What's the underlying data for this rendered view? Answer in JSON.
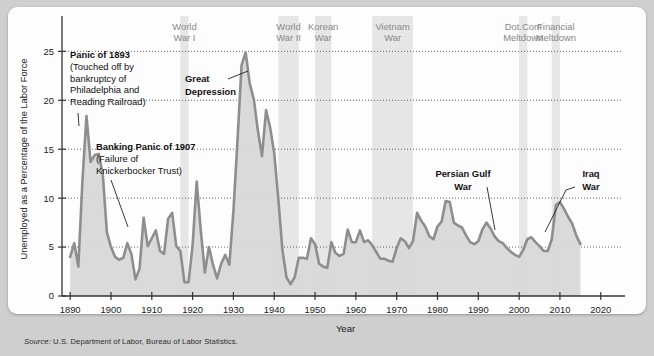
{
  "figure": {
    "source_prefix": "Source:",
    "source_text": "U.S. Department of Labor, Bureau of Labor Statistics."
  },
  "chart_data": {
    "type": "area",
    "title": "",
    "xlabel": "Year",
    "ylabel": "Unemployed as a Percentage of the Labor Force",
    "xlim": [
      1888,
      2023
    ],
    "ylim": [
      0,
      28
    ],
    "grid": "horizontal dotted at y ticks",
    "legend": "none",
    "y_ticks": [
      0,
      5,
      10,
      15,
      20,
      25
    ],
    "x_ticks": [
      1890,
      1900,
      1910,
      1920,
      1930,
      1940,
      1950,
      1960,
      1970,
      1980,
      1990,
      2000,
      2010,
      2020
    ],
    "series_name": "Unemployment rate",
    "line_color": "#8e8e8e",
    "fill_color": "#d8d8d8",
    "band_color": "#e6e6e6",
    "x": [
      1890,
      1891,
      1892,
      1893,
      1894,
      1895,
      1896,
      1897,
      1898,
      1899,
      1900,
      1901,
      1902,
      1903,
      1904,
      1905,
      1906,
      1907,
      1908,
      1909,
      1910,
      1911,
      1912,
      1913,
      1914,
      1915,
      1916,
      1917,
      1918,
      1919,
      1920,
      1921,
      1922,
      1923,
      1924,
      1925,
      1926,
      1927,
      1928,
      1929,
      1930,
      1931,
      1932,
      1933,
      1934,
      1935,
      1936,
      1937,
      1938,
      1939,
      1940,
      1941,
      1942,
      1943,
      1944,
      1945,
      1946,
      1947,
      1948,
      1949,
      1950,
      1951,
      1952,
      1953,
      1954,
      1955,
      1956,
      1957,
      1958,
      1959,
      1960,
      1961,
      1962,
      1963,
      1964,
      1965,
      1966,
      1967,
      1968,
      1969,
      1970,
      1971,
      1972,
      1973,
      1974,
      1975,
      1976,
      1977,
      1978,
      1979,
      1980,
      1981,
      1982,
      1983,
      1984,
      1985,
      1986,
      1987,
      1988,
      1989,
      1990,
      1991,
      1992,
      1993,
      1994,
      1995,
      1996,
      1997,
      1998,
      1999,
      2000,
      2001,
      2002,
      2003,
      2004,
      2005,
      2006,
      2007,
      2008,
      2009,
      2010,
      2011,
      2012,
      2013,
      2014,
      2015
    ],
    "values": [
      4.0,
      5.4,
      3.0,
      11.7,
      18.4,
      13.7,
      14.4,
      14.5,
      12.4,
      6.5,
      5.0,
      4.0,
      3.7,
      3.9,
      5.4,
      4.3,
      1.7,
      2.8,
      8.0,
      5.1,
      5.9,
      6.7,
      4.6,
      4.3,
      7.9,
      8.5,
      5.1,
      4.6,
      1.4,
      1.4,
      5.2,
      11.7,
      6.7,
      2.4,
      5.0,
      3.2,
      1.8,
      3.3,
      4.2,
      3.2,
      8.7,
      15.9,
      23.6,
      24.9,
      21.7,
      20.1,
      16.9,
      14.3,
      19.0,
      17.2,
      14.6,
      9.9,
      4.7,
      1.9,
      1.2,
      1.9,
      3.9,
      3.9,
      3.8,
      5.9,
      5.3,
      3.3,
      3.0,
      2.9,
      5.5,
      4.4,
      4.1,
      4.3,
      6.8,
      5.5,
      5.5,
      6.7,
      5.5,
      5.7,
      5.2,
      4.5,
      3.8,
      3.8,
      3.6,
      3.5,
      4.9,
      5.9,
      5.6,
      4.9,
      5.6,
      8.5,
      7.7,
      7.1,
      6.1,
      5.8,
      7.1,
      7.6,
      9.7,
      9.6,
      7.5,
      7.2,
      7.0,
      6.2,
      5.5,
      5.3,
      5.6,
      6.8,
      7.5,
      6.9,
      6.1,
      5.6,
      5.4,
      4.9,
      4.5,
      4.2,
      4.0,
      4.7,
      5.8,
      6.0,
      5.5,
      5.1,
      4.6,
      4.6,
      5.8,
      9.3,
      9.6,
      8.9,
      8.1,
      7.4,
      6.2,
      5.3
    ]
  },
  "bands": [
    {
      "label_line1": "World",
      "label_line2": "War I",
      "start": 1917,
      "end": 1918
    },
    {
      "label_line1": "World",
      "label_line2": "War II",
      "start": 1941,
      "end": 1945
    },
    {
      "label_line1": "Korean",
      "label_line2": "War",
      "start": 1950,
      "end": 1953
    },
    {
      "label_line1": "Vietnam",
      "label_line2": "War",
      "start": 1964,
      "end": 1973
    },
    {
      "label_line1": "Dot.Com",
      "label_line2": "Meltdown",
      "start": 2000,
      "end": 2001
    },
    {
      "label_line1": "Financial",
      "label_line2": "Meltdown",
      "start": 2008,
      "end": 2009
    }
  ],
  "annotations": [
    {
      "id": "panic1893",
      "bold": "Panic of 1893",
      "lines": [
        "(Touched off by",
        "bankruptcy of",
        "Philadelphia and",
        "Reading Railroad)"
      ]
    },
    {
      "id": "panic1907",
      "bold": "Banking Panic of 1907",
      "lines": [
        "(Failure of",
        "Knickerbocker Trust)"
      ]
    },
    {
      "id": "greatdepression",
      "bold_lines": [
        "Great",
        "Depression"
      ]
    },
    {
      "id": "persiangulf",
      "bold_lines": [
        "Persian Gulf",
        "War"
      ]
    },
    {
      "id": "iraqwar",
      "bold_lines": [
        "Iraq",
        "War"
      ]
    }
  ]
}
